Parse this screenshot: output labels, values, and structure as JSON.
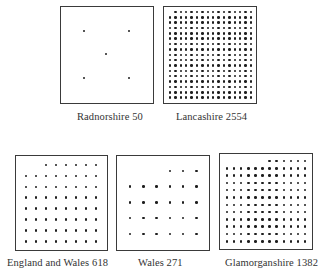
{
  "figure": {
    "panels": [
      {
        "id": "radnorshire",
        "label": "Radnorshire 50",
        "name": "Radnorshire",
        "value": 50,
        "box": {
          "x": 60,
          "y": 6,
          "w": 94,
          "h": 98
        },
        "label_pos": {
          "x": 77,
          "y": 111
        },
        "dots_mode": "points",
        "points": [
          [
            84,
            31
          ],
          [
            129,
            31
          ],
          [
            106,
            54
          ],
          [
            84,
            78
          ],
          [
            129,
            78
          ]
        ]
      },
      {
        "id": "lancashire",
        "label": "Lancashire 2554",
        "name": "Lancashire",
        "value": 2554,
        "box": {
          "x": 163,
          "y": 6,
          "w": 94,
          "h": 98
        },
        "label_pos": {
          "x": 176,
          "y": 111
        },
        "dots_mode": "grid",
        "grid": {
          "x0": 170,
          "y0": 12,
          "dx": 5.4,
          "dy": 5.35,
          "cols": 16,
          "rows": 17,
          "first_row_start_col": 1
        }
      },
      {
        "id": "england-wales",
        "label": "England and Wales 618",
        "name": "England and Wales",
        "value": 618,
        "box": {
          "x": 15,
          "y": 155,
          "w": 93,
          "h": 96
        },
        "label_pos": {
          "x": 7,
          "y": 257
        },
        "dots_mode": "grid",
        "grid": {
          "x0": 26,
          "y0": 165,
          "dx": 10,
          "dy": 10.9,
          "cols": 8,
          "rows": 8,
          "first_row_start_col": 2
        }
      },
      {
        "id": "wales",
        "label": "Wales 271",
        "name": "Wales",
        "value": 271,
        "box": {
          "x": 116,
          "y": 155,
          "w": 94,
          "h": 96
        },
        "label_pos": {
          "x": 138,
          "y": 257
        },
        "dots_mode": "grid",
        "grid": {
          "x0": 130,
          "y0": 171,
          "dx": 13.3,
          "dy": 15.7,
          "cols": 6,
          "rows": 5,
          "first_row_start_col": 3
        }
      },
      {
        "id": "glamorganshire",
        "label": "Glamorganshire 1382",
        "name": "Glamorganshire",
        "value": 1382,
        "box": {
          "x": 219,
          "y": 153,
          "w": 94,
          "h": 97
        },
        "label_pos": {
          "x": 225,
          "y": 257
        },
        "dots_mode": "grid",
        "grid": {
          "x0": 227,
          "y0": 161,
          "dx": 7.1,
          "dy": 7.3,
          "cols": 12,
          "rows": 12,
          "first_row_start_col": 6
        }
      }
    ]
  },
  "chart_data": {
    "type": "dot-density",
    "title": "",
    "categories": [
      "Radnorshire",
      "Lancashire",
      "England and Wales",
      "Wales",
      "Glamorganshire"
    ],
    "values": [
      50,
      2554,
      618,
      271,
      1382
    ],
    "labels": [
      "Radnorshire 50",
      "Lancashire 2554",
      "England and Wales 618",
      "Wales 271",
      "Glamorganshire 1382"
    ]
  }
}
